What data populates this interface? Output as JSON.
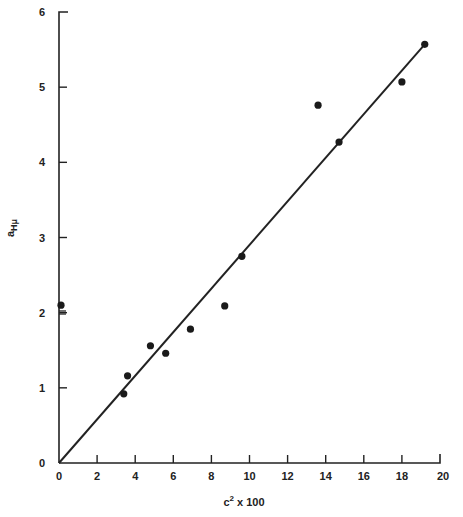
{
  "chart_data": {
    "type": "scatter",
    "title": "",
    "xlabel": "c² x 100",
    "ylabel": "a_Hμ",
    "xlim": [
      0,
      20
    ],
    "ylim": [
      0,
      6
    ],
    "x_ticks": [
      0,
      2,
      4,
      6,
      8,
      10,
      12,
      14,
      16,
      18,
      20
    ],
    "y_ticks": [
      0,
      1,
      2,
      3,
      4,
      5,
      6
    ],
    "grid": false,
    "legend": null,
    "series": [
      {
        "name": "measured",
        "marker": "filled-circle",
        "points": [
          {
            "x": 0.0,
            "y": 2.1
          },
          {
            "x": 3.4,
            "y": 0.92
          },
          {
            "x": 3.6,
            "y": 1.16
          },
          {
            "x": 4.8,
            "y": 1.56
          },
          {
            "x": 5.6,
            "y": 1.46
          },
          {
            "x": 6.9,
            "y": 1.78
          },
          {
            "x": 8.7,
            "y": 2.09
          },
          {
            "x": 9.6,
            "y": 2.75
          },
          {
            "x": 13.6,
            "y": 4.76
          },
          {
            "x": 14.7,
            "y": 4.27
          },
          {
            "x": 18.0,
            "y": 5.07
          },
          {
            "x": 19.2,
            "y": 5.57
          }
        ]
      },
      {
        "name": "linear fit",
        "marker": "line",
        "points": [
          {
            "x": 0,
            "y": 0
          },
          {
            "x": 19.2,
            "y": 5.57
          }
        ]
      }
    ],
    "annotations": [
      "double short tick marks on y-axis just below 2"
    ]
  },
  "labels": {
    "x_axis_title_base": "c",
    "x_axis_title_sup": "2",
    "x_axis_title_rest": " x 100",
    "y_axis_title_base": "a",
    "y_axis_title_sub": "Hμ"
  }
}
